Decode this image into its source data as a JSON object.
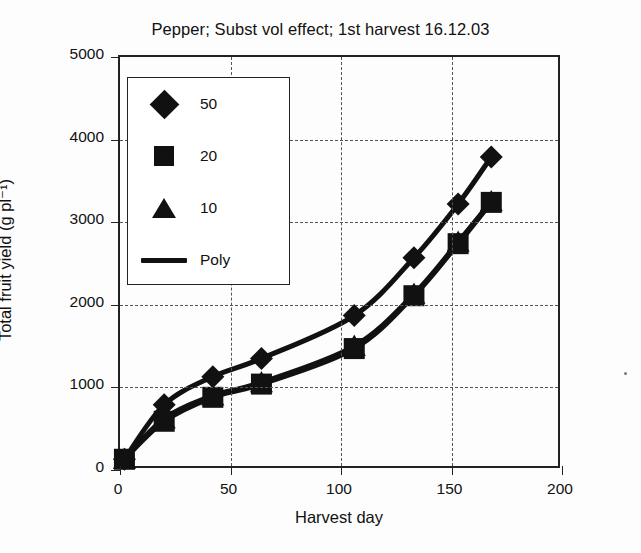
{
  "chart_data": {
    "type": "line",
    "title": "Pepper; Subst vol effect; 1st harvest 16.12.03",
    "xlabel": "Harvest day",
    "ylabel": "Total fruit yield (g pl⁻¹)",
    "xlim": [
      0,
      200
    ],
    "ylim": [
      0,
      5000
    ],
    "xticks": [
      0,
      50,
      100,
      150,
      200
    ],
    "yticks": [
      0,
      1000,
      2000,
      3000,
      4000,
      5000
    ],
    "xtick_labels": [
      "0",
      "50",
      "100",
      "150",
      "200"
    ],
    "ytick_labels": [
      "0",
      "1000",
      "2000",
      "3000",
      "4000",
      "5000"
    ],
    "grid": "dashed both axes",
    "legend_position": "upper left (inside plot)",
    "legend_entries": [
      {
        "label": "50",
        "marker": "diamond"
      },
      {
        "label": "20",
        "marker": "square"
      },
      {
        "label": "10",
        "marker": "triangle"
      },
      {
        "label": "Poly",
        "marker": "line"
      }
    ],
    "series": [
      {
        "name": "50",
        "marker": "diamond",
        "x": [
          2,
          20,
          42,
          64,
          106,
          133,
          153,
          168
        ],
        "values": [
          130,
          790,
          1130,
          1350,
          1870,
          2570,
          3220,
          3790
        ]
      },
      {
        "name": "20",
        "marker": "square",
        "x": [
          2,
          20,
          42,
          64,
          106,
          133,
          153,
          168
        ],
        "values": [
          130,
          590,
          880,
          1040,
          1470,
          2110,
          2740,
          3240
        ]
      },
      {
        "name": "10",
        "marker": "triangle",
        "x": [
          2,
          20,
          42,
          64,
          106,
          133,
          153,
          168
        ],
        "values": [
          130,
          620,
          900,
          1060,
          1500,
          2130,
          2760,
          3250
        ]
      },
      {
        "name": "Poly",
        "marker": "line",
        "note": "polynomial trend lines drawn through both marker series"
      }
    ]
  }
}
